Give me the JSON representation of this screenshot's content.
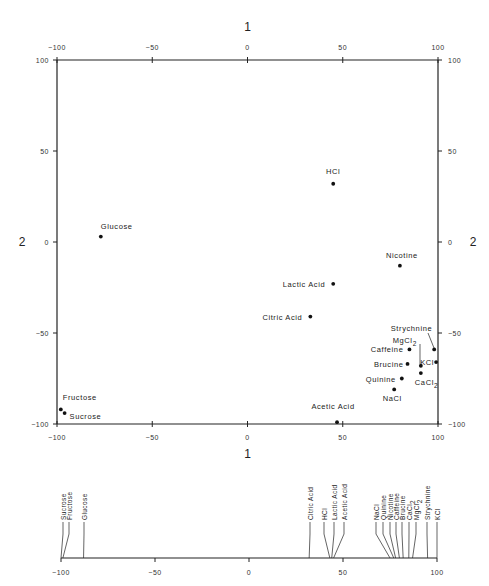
{
  "chart_data": [
    {
      "type": "scatter",
      "title": "",
      "xlabel": "1",
      "ylabel": "2",
      "xlim": [
        -100,
        100
      ],
      "ylim": [
        -100,
        100
      ],
      "grid": false,
      "x_ticks": [
        -100,
        -50,
        0,
        50,
        100
      ],
      "y_ticks": [
        -100,
        -50,
        0,
        50,
        100
      ],
      "points": [
        {
          "label": "HCl",
          "x": 45,
          "y": 32
        },
        {
          "label": "Glucose",
          "x": -77,
          "y": 3
        },
        {
          "label": "Nicotine",
          "x": 80,
          "y": -13
        },
        {
          "label": "Lactic Acid",
          "x": 45,
          "y": -23
        },
        {
          "label": "Citric Acid",
          "x": 33,
          "y": -41
        },
        {
          "label": "Strychnine",
          "x": 98,
          "y": -59
        },
        {
          "label": "MgCl2",
          "x": 91,
          "y": -68
        },
        {
          "label": "Caffeine",
          "x": 85,
          "y": -59
        },
        {
          "label": "KCl",
          "x": 99,
          "y": -66
        },
        {
          "label": "Brucine",
          "x": 84,
          "y": -67
        },
        {
          "label": "CaCl2",
          "x": 91,
          "y": -72
        },
        {
          "label": "Quinine",
          "x": 81,
          "y": -75
        },
        {
          "label": "NaCl",
          "x": 77,
          "y": -81
        },
        {
          "label": "Acetic Acid",
          "x": 47,
          "y": -99
        },
        {
          "label": "Fructose",
          "x": -98,
          "y": -92
        },
        {
          "label": "Sucrose",
          "x": -96,
          "y": -94
        }
      ]
    },
    {
      "type": "strip",
      "title": "",
      "xlabel": "",
      "xlim": [
        -100,
        100
      ],
      "x_ticks": [
        -100,
        -50,
        0,
        50,
        100
      ],
      "points": [
        {
          "label": "Sucrose",
          "x": -100
        },
        {
          "label": "Fructose",
          "x": -99
        },
        {
          "label": "Glucose",
          "x": -88
        },
        {
          "label": "Citric Acid",
          "x": 32
        },
        {
          "label": "HCl",
          "x": 43
        },
        {
          "label": "Lactic Acid",
          "x": 44
        },
        {
          "label": "Acetic Acid",
          "x": 45
        },
        {
          "label": "NaCl",
          "x": 75
        },
        {
          "label": "Quinine",
          "x": 77
        },
        {
          "label": "Nicotine",
          "x": 78
        },
        {
          "label": "Caffeine",
          "x": 80
        },
        {
          "label": "Brucine",
          "x": 82
        },
        {
          "label": "CaCl2",
          "x": 85
        },
        {
          "label": "MgCl2",
          "x": 87
        },
        {
          "label": "Strychnine",
          "x": 95
        },
        {
          "label": "KCl",
          "x": 100
        }
      ]
    }
  ],
  "axes": {
    "top_title": "1",
    "bottom_title": "1",
    "left_title": "2",
    "right_title": "2"
  }
}
